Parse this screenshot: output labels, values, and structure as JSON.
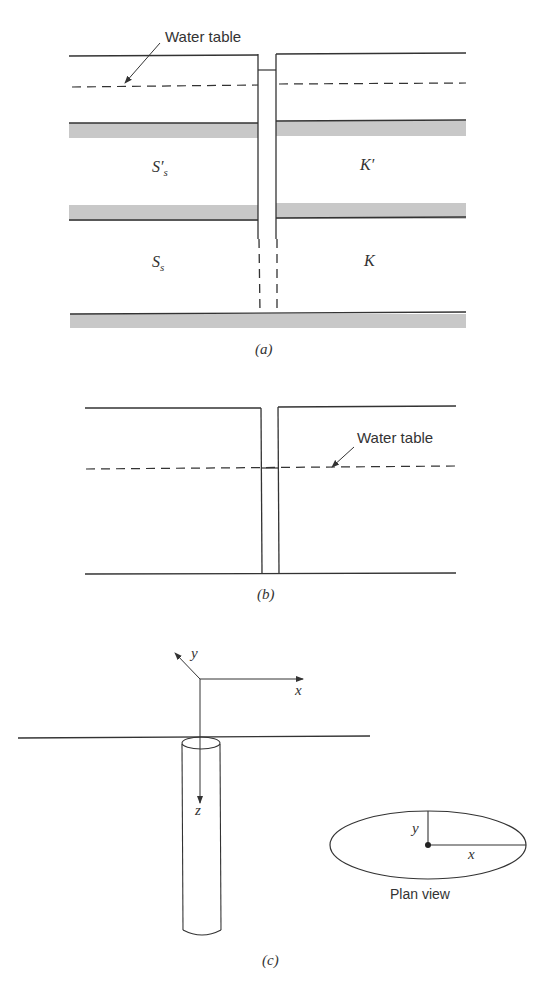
{
  "panel_a": {
    "water_table_label": "Water table",
    "upper_left_label": "S′",
    "upper_left_sub": "s",
    "upper_right_label": "K′",
    "lower_left_label": "S",
    "lower_left_sub": "s",
    "lower_right_label": "K",
    "caption": "(a)"
  },
  "panel_b": {
    "water_table_label": "Water table",
    "caption": "(b)"
  },
  "panel_c": {
    "axis_x": "x",
    "axis_y": "y",
    "axis_z": "z",
    "plan_x": "x",
    "plan_y": "y",
    "plan_label": "Plan view",
    "caption": "(c)"
  },
  "colors": {
    "line": "#333333",
    "band": "#c8c8c8"
  }
}
